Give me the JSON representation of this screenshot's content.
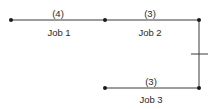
{
  "diagram": {
    "type": "activity-network",
    "colors": {
      "line": "#3a3a3a",
      "node": "#1a1a1a",
      "text": "#2a2a2a"
    },
    "jobs": [
      {
        "name": "Job 1",
        "duration": "(4)"
      },
      {
        "name": "Job 2",
        "duration": "(3)"
      },
      {
        "name": "Job 3",
        "duration": "(3)"
      }
    ]
  }
}
